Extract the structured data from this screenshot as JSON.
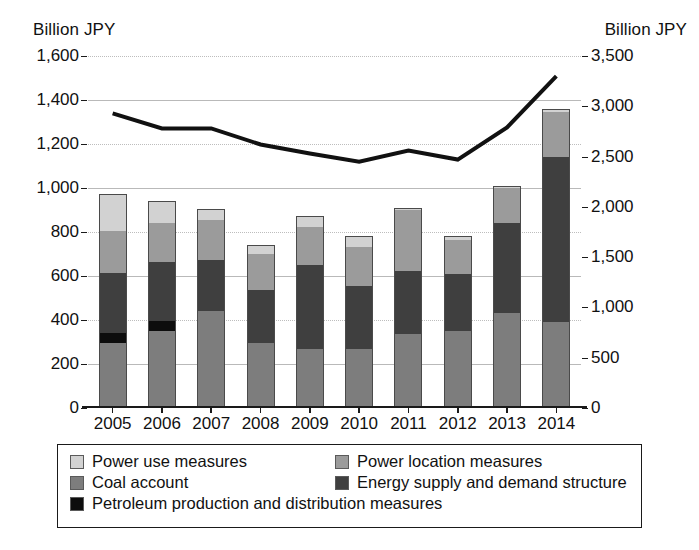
{
  "axes": {
    "left_unit": "Billion JPY",
    "right_unit": "Billion JPY",
    "left_ticks": [
      "1,600",
      "1,400",
      "1,200",
      "1,000",
      "800",
      "600",
      "400",
      "200",
      "0"
    ],
    "right_ticks": [
      "3,500",
      "3,000",
      "2,500",
      "2,000",
      "1,500",
      "1,000",
      "500",
      "0"
    ]
  },
  "legend": {
    "items": [
      {
        "label": "Power use measures",
        "color": "#d2d2d2",
        "key": "power_use"
      },
      {
        "label": "Power location measures",
        "color": "#9b9b9b",
        "key": "power_location"
      },
      {
        "label": "Coal account",
        "color": "#7d7d7d",
        "key": "coal_account"
      },
      {
        "label": "Energy supply and demand structure",
        "color": "#3f3f3f",
        "key": "energy_supply"
      },
      {
        "label": "Petroleum production and distribution measures",
        "color": "#0d0d0d",
        "key": "petroleum"
      }
    ]
  },
  "chart_data": {
    "type": "bar",
    "title": "",
    "xlabel": "",
    "ylabel": "Billion JPY",
    "categories": [
      "2005",
      "2006",
      "2007",
      "2008",
      "2009",
      "2010",
      "2011",
      "2012",
      "2013",
      "2014"
    ],
    "ylim": [
      0,
      1600
    ],
    "y2lim": [
      0,
      3500
    ],
    "y2label": "Billion JPY",
    "grid": true,
    "stacked": true,
    "legend_position": "bottom",
    "series": [
      {
        "name": "Coal account",
        "axis": "left",
        "type": "bar",
        "color": "#7d7d7d",
        "values": [
          295,
          350,
          440,
          295,
          270,
          270,
          335,
          350,
          430,
          390
        ]
      },
      {
        "name": "Petroleum production and distribution measures",
        "axis": "left",
        "type": "bar",
        "color": "#0d0d0d",
        "values": [
          45,
          45,
          0,
          0,
          0,
          0,
          0,
          0,
          0,
          0
        ]
      },
      {
        "name": "Energy supply and demand structure",
        "axis": "left",
        "type": "bar",
        "color": "#3f3f3f",
        "values": [
          275,
          270,
          235,
          240,
          380,
          285,
          290,
          260,
          410,
          750
        ]
      },
      {
        "name": "Power location measures",
        "axis": "left",
        "type": "bar",
        "color": "#9b9b9b",
        "values": [
          190,
          175,
          180,
          165,
          175,
          175,
          275,
          155,
          160,
          205
        ]
      },
      {
        "name": "Power use measures",
        "axis": "left",
        "type": "bar",
        "color": "#d2d2d2",
        "values": [
          170,
          100,
          50,
          40,
          50,
          50,
          10,
          15,
          10,
          15
        ]
      }
    ],
    "totals_left_axis": [
      975,
      940,
      905,
      740,
      875,
      780,
      910,
      780,
      1010,
      1360
    ],
    "line_series": {
      "name": "Total (right axis)",
      "axis": "right",
      "type": "line",
      "color": "#111111",
      "values": [
        2930,
        2780,
        2780,
        2620,
        2530,
        2450,
        2560,
        2470,
        2790,
        3300
      ]
    }
  }
}
